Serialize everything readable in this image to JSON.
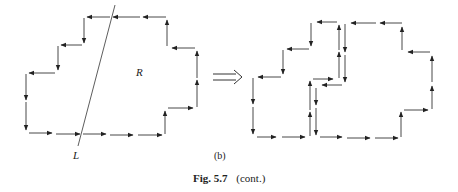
{
  "figure": {
    "region_label": "R",
    "line_label": "L",
    "panel_label": "(b)",
    "caption_prefix": "Fig. 5.7",
    "caption_suffix": "(cont.)",
    "implication_arrow": "⟹"
  }
}
